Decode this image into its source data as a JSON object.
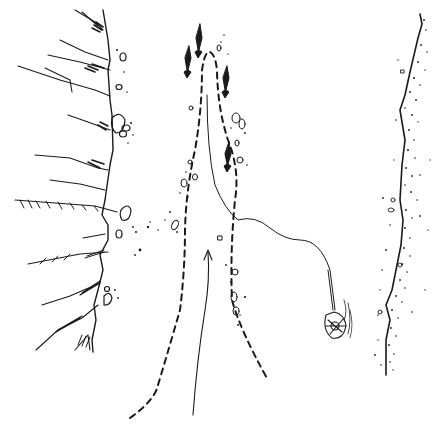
{
  "figure": {
    "width": 437,
    "height": 429,
    "background": "#ffffff",
    "ink": "#1a1a1a"
  },
  "elements": {
    "cliff": {
      "label": "cliff-face"
    },
    "dashed_path": {
      "label": "dashed-route"
    },
    "down_arrows": {
      "count": 4
    },
    "up_arrow": {
      "label": "upward-route-arrow"
    },
    "rope": {
      "label": "rope-line"
    },
    "net_bundle": {
      "label": "hanging-net"
    },
    "shoreline": {
      "label": "stippled-shoreline"
    }
  }
}
